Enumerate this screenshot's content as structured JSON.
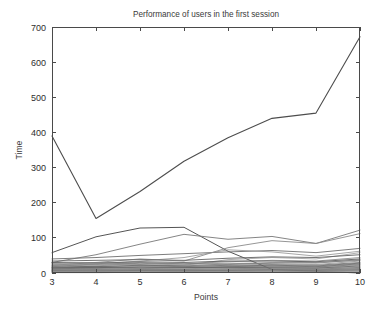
{
  "chart_data": {
    "type": "line",
    "title": "Performance of users in the first session",
    "xlabel": "Points",
    "ylabel": "Time",
    "xlim": [
      3,
      10
    ],
    "ylim": [
      0,
      700
    ],
    "xticks": [
      3,
      4,
      5,
      6,
      7,
      8,
      9,
      10
    ],
    "xticklabels": [
      "3",
      "4",
      "5",
      "6",
      "7",
      "8",
      "9",
      "10"
    ],
    "yticks": [
      0,
      100,
      200,
      300,
      400,
      500,
      600,
      700
    ],
    "yticklabels": [
      "0",
      "100",
      "200",
      "300",
      "400",
      "500",
      "600",
      "700"
    ],
    "grid": false,
    "legend": "none",
    "box": true,
    "tick_direction": "in",
    "x": [
      3,
      4,
      5,
      6,
      7,
      8,
      9,
      10
    ],
    "series": [
      {
        "name": "user-1",
        "color": "#4d4d4d",
        "width": 1.1,
        "values": [
          390,
          155,
          232,
          318,
          385,
          440,
          455,
          672
        ]
      },
      {
        "name": "user-2",
        "color": "#555555",
        "width": 1.0,
        "values": [
          58,
          103,
          128,
          130,
          62,
          10,
          5,
          0
        ]
      },
      {
        "name": "user-3",
        "color": "#777777",
        "width": 0.9,
        "values": [
          30,
          52,
          82,
          110,
          96,
          104,
          84,
          122
        ]
      },
      {
        "name": "user-4",
        "color": "#8a8a8a",
        "width": 0.9,
        "values": [
          22,
          30,
          40,
          34,
          72,
          92,
          84,
          112
        ]
      },
      {
        "name": "user-5",
        "color": "#6e6e6e",
        "width": 0.9,
        "values": [
          40,
          44,
          50,
          55,
          60,
          64,
          58,
          70
        ]
      },
      {
        "name": "user-6",
        "color": "#909090",
        "width": 0.8,
        "values": [
          18,
          26,
          34,
          44,
          66,
          60,
          48,
          62
        ]
      },
      {
        "name": "user-7",
        "color": "#999999",
        "width": 0.8,
        "values": [
          14,
          20,
          28,
          22,
          38,
          44,
          40,
          58
        ]
      },
      {
        "name": "user-8",
        "color": "#636363",
        "width": 0.9,
        "values": [
          34,
          36,
          38,
          36,
          42,
          46,
          44,
          52
        ]
      },
      {
        "name": "user-9",
        "color": "#7d7d7d",
        "width": 0.8,
        "values": [
          26,
          24,
          30,
          26,
          32,
          36,
          34,
          44
        ]
      },
      {
        "name": "user-10",
        "color": "#848484",
        "width": 0.8,
        "values": [
          20,
          22,
          24,
          20,
          26,
          30,
          28,
          38
        ]
      },
      {
        "name": "user-11",
        "color": "#5c5c5c",
        "width": 0.9,
        "values": [
          30,
          28,
          32,
          30,
          34,
          34,
          32,
          40
        ]
      },
      {
        "name": "user-12",
        "color": "#707070",
        "width": 0.8,
        "values": [
          16,
          18,
          20,
          18,
          22,
          24,
          22,
          30
        ]
      },
      {
        "name": "user-13",
        "color": "#8e8e8e",
        "width": 0.8,
        "values": [
          24,
          26,
          22,
          24,
          28,
          26,
          24,
          34
        ]
      },
      {
        "name": "user-14",
        "color": "#6a6a6a",
        "width": 0.8,
        "values": [
          12,
          14,
          16,
          15,
          18,
          20,
          18,
          26
        ]
      },
      {
        "name": "user-15",
        "color": "#7a7a7a",
        "width": 0.8,
        "values": [
          28,
          30,
          26,
          28,
          24,
          28,
          30,
          36
        ]
      },
      {
        "name": "user-16",
        "color": "#959595",
        "width": 0.7,
        "values": [
          10,
          12,
          13,
          12,
          15,
          16,
          15,
          22
        ]
      },
      {
        "name": "user-17",
        "color": "#666666",
        "width": 0.8,
        "values": [
          20,
          18,
          22,
          20,
          20,
          22,
          20,
          28
        ]
      },
      {
        "name": "user-18",
        "color": "#888888",
        "width": 0.7,
        "values": [
          8,
          10,
          11,
          10,
          12,
          14,
          13,
          18
        ]
      },
      {
        "name": "user-19",
        "color": "#747474",
        "width": 0.8,
        "values": [
          16,
          15,
          18,
          16,
          17,
          18,
          17,
          24
        ]
      },
      {
        "name": "user-20",
        "color": "#9c9c9c",
        "width": 0.7,
        "values": [
          6,
          7,
          8,
          8,
          10,
          11,
          10,
          15
        ]
      },
      {
        "name": "user-21",
        "color": "#5f5f5f",
        "width": 0.8,
        "values": [
          14,
          16,
          14,
          15,
          16,
          15,
          14,
          20
        ]
      },
      {
        "name": "user-22",
        "color": "#828282",
        "width": 0.7,
        "values": [
          5,
          6,
          6,
          6,
          8,
          9,
          8,
          12
        ]
      },
      {
        "name": "user-23",
        "color": "#6c6c6c",
        "width": 0.7,
        "values": [
          11,
          12,
          10,
          11,
          12,
          12,
          11,
          16
        ]
      },
      {
        "name": "user-24",
        "color": "#919191",
        "width": 0.7,
        "values": [
          4,
          4,
          5,
          5,
          6,
          6,
          6,
          9
        ]
      },
      {
        "name": "user-25",
        "color": "#787878",
        "width": 0.7,
        "values": [
          9,
          9,
          8,
          9,
          9,
          10,
          9,
          13
        ]
      },
      {
        "name": "user-26",
        "color": "#868686",
        "width": 0.7,
        "values": [
          3,
          3,
          3,
          4,
          4,
          5,
          4,
          7
        ]
      },
      {
        "name": "user-27",
        "color": "#6f6f6f",
        "width": 0.7,
        "values": [
          7,
          8,
          7,
          7,
          7,
          8,
          7,
          10
        ]
      },
      {
        "name": "user-28",
        "color": "#9a9a9a",
        "width": 0.7,
        "values": [
          2,
          2,
          2,
          3,
          3,
          3,
          3,
          5
        ]
      },
      {
        "name": "user-29",
        "color": "#7e7e7e",
        "width": 0.7,
        "values": [
          6,
          5,
          6,
          6,
          6,
          6,
          5,
          8
        ]
      },
      {
        "name": "user-30",
        "color": "#8b8b8b",
        "width": 0.7,
        "values": [
          1,
          1,
          2,
          2,
          2,
          2,
          2,
          4
        ]
      }
    ]
  }
}
